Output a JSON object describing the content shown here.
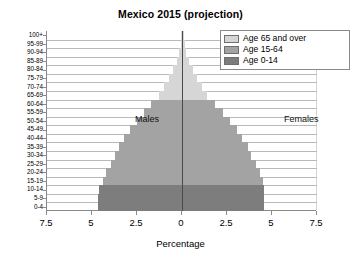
{
  "chart_data": {
    "type": "bar",
    "subtype": "population-pyramid",
    "title": "Mexico 2015 (projection)",
    "xlabel": "Percentage",
    "ylabel": "",
    "xlim": [
      -7.5,
      7.5
    ],
    "xticks": [
      "7.5",
      "5",
      "2.5",
      "0",
      "2.5",
      "5",
      "7.5"
    ],
    "xtick_values": [
      -7.5,
      -5,
      -2.5,
      0,
      2.5,
      5,
      7.5
    ],
    "grid": true,
    "legend_position": "top-right",
    "annotations": [
      {
        "text": "Males",
        "side": "left"
      },
      {
        "text": "Females",
        "side": "right"
      }
    ],
    "categories": [
      "100+",
      "95-99",
      "90-94",
      "85-89",
      "80-84",
      "75-79",
      "70-74",
      "65-69",
      "60-64",
      "55-59",
      "50-54",
      "45-49",
      "40-44",
      "35-39",
      "30-34",
      "25-29",
      "20-24",
      "15-19",
      "10-14",
      "5-9",
      "0-4"
    ],
    "series": [
      {
        "name": "Males",
        "direction": "left",
        "values": [
          0.03,
          0.07,
          0.15,
          0.3,
          0.5,
          0.75,
          1.0,
          1.3,
          1.7,
          2.1,
          2.5,
          2.9,
          3.2,
          3.5,
          3.7,
          3.95,
          4.2,
          4.4,
          4.6,
          4.65,
          4.65
        ]
      },
      {
        "name": "Females",
        "direction": "right",
        "values": [
          0.04,
          0.09,
          0.18,
          0.33,
          0.55,
          0.8,
          1.05,
          1.35,
          1.8,
          2.2,
          2.6,
          3.0,
          3.3,
          3.6,
          3.8,
          4.05,
          4.3,
          4.45,
          4.5,
          4.5,
          4.5
        ]
      }
    ],
    "age_group_colors": [
      {
        "group": "Age 65 and over",
        "color": "#d6d6d6",
        "categories": [
          "100+",
          "95-99",
          "90-94",
          "85-89",
          "80-84",
          "75-79",
          "70-74",
          "65-69"
        ]
      },
      {
        "group": "Age 15-64",
        "color": "#a3a3a3",
        "categories": [
          "60-64",
          "55-59",
          "50-54",
          "45-49",
          "40-44",
          "35-39",
          "30-34",
          "25-29",
          "20-24",
          "15-19"
        ]
      },
      {
        "group": "Age 0-14",
        "color": "#7d7d7d",
        "categories": [
          "10-14",
          "5-9",
          "0-4"
        ]
      }
    ],
    "legend": [
      {
        "label": "Age 65 and over",
        "color": "#d6d6d6"
      },
      {
        "label": "Age 15-64",
        "color": "#a3a3a3"
      },
      {
        "label": "Age 0-14",
        "color": "#7d7d7d"
      }
    ]
  }
}
